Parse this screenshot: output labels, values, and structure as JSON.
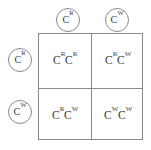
{
  "diagram": {
    "type": "punnett-square",
    "size": "2x2",
    "symbol": "C",
    "alleles": {
      "red": {
        "base": "C",
        "superscript": "R"
      },
      "white": {
        "base": "C",
        "superscript": "W"
      }
    },
    "top_gametes": [
      {
        "base": "C",
        "superscript": "R",
        "label": "CR"
      },
      {
        "base": "C",
        "superscript": "W",
        "label": "CW"
      }
    ],
    "left_gametes": [
      {
        "base": "C",
        "superscript": "R",
        "label": "CR"
      },
      {
        "base": "C",
        "superscript": "W",
        "label": "CW"
      }
    ],
    "cells": [
      {
        "position": "top-left",
        "label": "CRCR",
        "first": {
          "base": "C",
          "superscript": "R"
        },
        "second": {
          "base": "C",
          "superscript": "R"
        }
      },
      {
        "position": "top-right",
        "label": "CRCW",
        "first": {
          "base": "C",
          "superscript": "R"
        },
        "second": {
          "base": "C",
          "superscript": "W"
        }
      },
      {
        "position": "bottom-left",
        "label": "CRCW",
        "first": {
          "base": "C",
          "superscript": "R"
        },
        "second": {
          "base": "C",
          "superscript": "W"
        }
      },
      {
        "position": "bottom-right",
        "label": "CWCW",
        "first": {
          "base": "C",
          "superscript": "W"
        },
        "second": {
          "base": "C",
          "superscript": "W"
        }
      }
    ],
    "colors": {
      "line": "#8a8a8a",
      "text": "#3a3a3a",
      "background": "#ffffff"
    }
  }
}
